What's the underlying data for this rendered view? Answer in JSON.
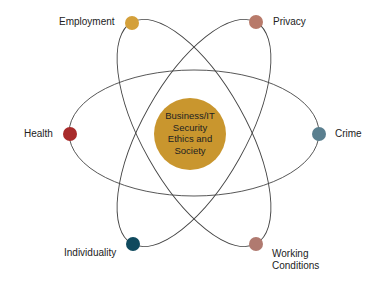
{
  "center": {
    "lines": [
      "Business/IT",
      "Security",
      "Ethics and",
      "Society"
    ],
    "color": "#c9962e"
  },
  "nodes": [
    {
      "label": "Employment",
      "color": "#d4a03a"
    },
    {
      "label": "Privacy",
      "color": "#b87a6a"
    },
    {
      "label": "Health",
      "color": "#a82a2a"
    },
    {
      "label": "Crime",
      "color": "#5a7f8f"
    },
    {
      "label": "Individuality",
      "color": "#0f4a5e"
    },
    {
      "label": "Working",
      "label2": "Conditions",
      "color": "#b07a70"
    }
  ]
}
